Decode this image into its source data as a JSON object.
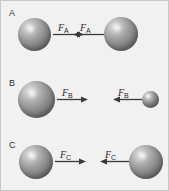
{
  "figure": {
    "background_color": "#f1f1f1",
    "border_color": "#c8c8c8",
    "sphere_color": "#8a8a8a",
    "arrow_color": "#3a3a3a",
    "text_color": "#2b2b2b"
  },
  "rows": [
    {
      "id": "A",
      "label": "A",
      "force_symbol": "F",
      "force_subscript": "A",
      "left_object": {
        "name": "sphere",
        "size": "medium",
        "diameter_px": 33
      },
      "right_object": {
        "name": "sphere",
        "size": "medium",
        "diameter_px": 34
      },
      "left_arrow_direction": "right",
      "right_arrow_direction": "left"
    },
    {
      "id": "B",
      "label": "B",
      "force_symbol": "F",
      "force_subscript": "B",
      "left_object": {
        "name": "sphere",
        "size": "large",
        "diameter_px": 37
      },
      "right_object": {
        "name": "sphere",
        "size": "small",
        "diameter_px": 17
      },
      "left_arrow_direction": "right",
      "right_arrow_direction": "left"
    },
    {
      "id": "C",
      "label": "C",
      "force_symbol": "F",
      "force_subscript": "C",
      "left_object": {
        "name": "sphere",
        "size": "medium",
        "diameter_px": 34
      },
      "right_object": {
        "name": "sphere",
        "size": "medium",
        "diameter_px": 34
      },
      "left_arrow_direction": "right",
      "right_arrow_direction": "left"
    }
  ]
}
